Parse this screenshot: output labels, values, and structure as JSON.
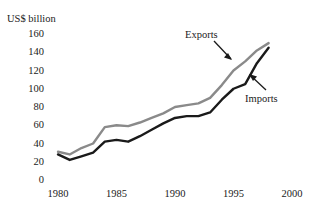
{
  "chart_data": {
    "type": "line",
    "title": "",
    "xlabel": "",
    "ylabel": "US$ billion",
    "ylim": [
      0,
      160
    ],
    "xlim": [
      1980,
      2000
    ],
    "grid": false,
    "legend_position": "inline-annotations",
    "yticks": [
      160,
      140,
      120,
      100,
      80,
      60,
      40,
      20,
      0
    ],
    "xticks": [
      1980,
      1985,
      1990,
      1995,
      2000
    ],
    "x": [
      1980,
      1981,
      1982,
      1983,
      1984,
      1985,
      1986,
      1987,
      1988,
      1989,
      1990,
      1991,
      1992,
      1993,
      1994,
      1995,
      1996,
      1997,
      1998
    ],
    "series": [
      {
        "name": "Exports",
        "color": "#8a8a8a",
        "values": [
          31,
          28,
          35,
          40,
          58,
          60,
          59,
          63,
          68,
          73,
          80,
          82,
          84,
          90,
          104,
          120,
          130,
          142,
          150
        ]
      },
      {
        "name": "Imports",
        "color": "#1a1a1a",
        "values": [
          28,
          22,
          26,
          30,
          42,
          44,
          42,
          48,
          55,
          62,
          68,
          70,
          70,
          74,
          88,
          100,
          105,
          128,
          145
        ]
      }
    ],
    "annotations": [
      {
        "label": "Exports",
        "points_to_series": "Exports"
      },
      {
        "label": "Imports",
        "points_to_series": "Imports"
      }
    ]
  },
  "axis": {
    "unit_label": "US$ billion",
    "ytick_labels": [
      "160",
      "140",
      "120",
      "100",
      "80",
      "60",
      "40",
      "20",
      "0"
    ],
    "xtick_labels": [
      "1980",
      "1985",
      "1990",
      "1995",
      "2000"
    ]
  },
  "annotations": {
    "exports_label": "Exports",
    "imports_label": "Imports"
  }
}
